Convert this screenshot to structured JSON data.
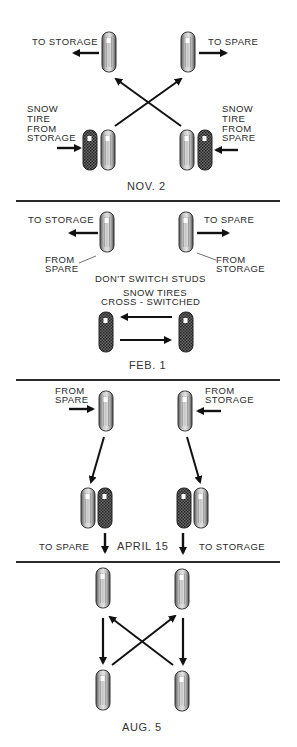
{
  "figure": {
    "type": "tire rotation schedule diagram",
    "panels": [
      {
        "date": "NOV. 2",
        "labels": {
          "top_left": "TO STORAGE",
          "top_right": "TO SPARE",
          "bottom_left": [
            "SNOW",
            "TIRE",
            "FROM",
            "STORAGE"
          ],
          "bottom_right": [
            "SNOW",
            "TIRE",
            "FROM",
            "SPARE"
          ]
        }
      },
      {
        "date": "FEB. 1",
        "labels": {
          "top_left": "TO STORAGE",
          "top_right": "TO SPARE",
          "from_left": [
            "FROM",
            "SPARE"
          ],
          "from_right": [
            "FROM",
            "STORAGE"
          ],
          "note": "DON'T SWITCH STUDS",
          "snow_note": [
            "SNOW TIRES",
            "CROSS - SWITCHED"
          ]
        }
      },
      {
        "date": "APRIL 15",
        "labels": {
          "from_left": [
            "FROM",
            "SPARE"
          ],
          "from_right": [
            "FROM",
            "STORAGE"
          ],
          "to_left": "TO SPARE",
          "to_right": "TO STORAGE"
        }
      },
      {
        "date": "AUG. 5",
        "labels": {}
      }
    ]
  },
  "colors": {
    "ink": "#1a1a1a",
    "regular_tire": "#9a9a9a",
    "snow_tire": "#3a3a3a",
    "background": "#ffffff"
  }
}
